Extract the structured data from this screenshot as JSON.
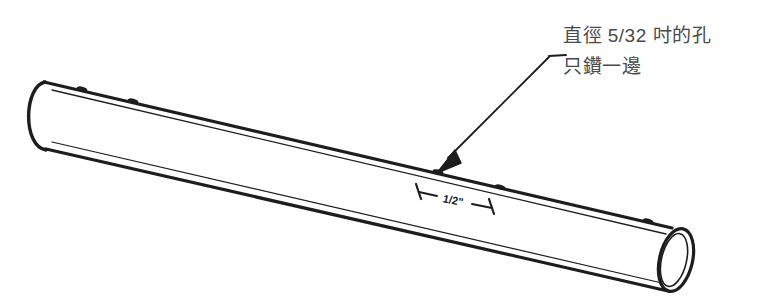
{
  "figure": {
    "background_color": "#ffffff",
    "line_color": "#1d1d1d",
    "text_color": "#4a4a4a",
    "width": 760,
    "height": 305
  },
  "callout": {
    "note_line_1": "直徑 5/32 吋的孔",
    "note_line_2": "只鑽一邊",
    "leader": {
      "elbow_x": 548,
      "elbow_y": 58,
      "stub_end_x": 566,
      "stub_end_y": 56,
      "arrow_tip_x": 437,
      "arrow_tip_y": 173
    }
  },
  "dimension": {
    "label": "1/2\"",
    "start_x": 415,
    "start_y": 191,
    "end_x": 492,
    "end_y": 207
  },
  "pipe": {
    "top_edge": {
      "x1": 40,
      "y1": 83,
      "x2": 672,
      "y2": 228
    },
    "bottom_edge": {
      "x1": 42,
      "y1": 148,
      "x2": 676,
      "y2": 292
    },
    "left_cap_arc": "open-ellipse-left-half",
    "right_cap_ellipse": {
      "cx": 676,
      "cy": 260,
      "rx": 16,
      "ry": 32
    },
    "hole_marks": [
      {
        "x": 82,
        "y": 89
      },
      {
        "x": 133,
        "y": 101
      },
      {
        "x": 437,
        "y": 173
      },
      {
        "x": 500,
        "y": 188
      },
      {
        "x": 648,
        "y": 222
      }
    ]
  }
}
